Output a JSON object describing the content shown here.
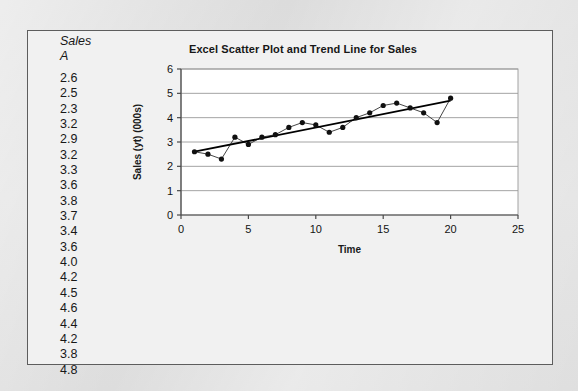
{
  "figure": {
    "spreadsheet": {
      "header_title": "Sales",
      "header_column": "A",
      "values": [
        "2.6",
        "2.5",
        "2.3",
        "3.2",
        "2.9",
        "3.2",
        "3.3",
        "3.6",
        "3.8",
        "3.7",
        "3.4",
        "3.6",
        "4.0",
        "4.2",
        "4.5",
        "4.6",
        "4.4",
        "4.2",
        "3.8",
        "4.8"
      ]
    },
    "colors": {
      "page_background": "#dcdcdc",
      "panel_background": "#f1f1f1",
      "panel_border": "#5d5d5d",
      "plot_background": "#ffffff",
      "gridline": "#9a9a9a",
      "axis": "#4a4a4a",
      "series_marker": "#101010",
      "series_line": "#303030",
      "trendline": "#000000",
      "text": "#171717"
    }
  },
  "chart_data": {
    "type": "scatter",
    "title": "Excel Scatter Plot and Trend Line for Sales",
    "xlabel": "Time",
    "ylabel": "Sales (yt) (000s)",
    "xlim": [
      0,
      25
    ],
    "ylim": [
      0,
      6
    ],
    "xticks": [
      0,
      5,
      10,
      15,
      20,
      25
    ],
    "yticks": [
      0,
      1,
      2,
      3,
      4,
      5,
      6
    ],
    "grid": "horizontal",
    "legend": "none",
    "series": [
      {
        "name": "Sales (yt) (000s)",
        "marker": "filled-circle",
        "connected": true,
        "x": [
          1,
          2,
          3,
          4,
          5,
          6,
          7,
          8,
          9,
          10,
          11,
          12,
          13,
          14,
          15,
          16,
          17,
          18,
          19,
          20
        ],
        "values": [
          2.6,
          2.5,
          2.3,
          3.2,
          2.9,
          3.2,
          3.3,
          3.6,
          3.8,
          3.7,
          3.4,
          3.6,
          4.0,
          4.2,
          4.5,
          4.6,
          4.4,
          4.2,
          3.8,
          4.8
        ]
      },
      {
        "name": "Trend Line",
        "type": "linear-trend",
        "x": [
          1,
          20
        ],
        "values": [
          2.6,
          4.7
        ]
      }
    ]
  }
}
